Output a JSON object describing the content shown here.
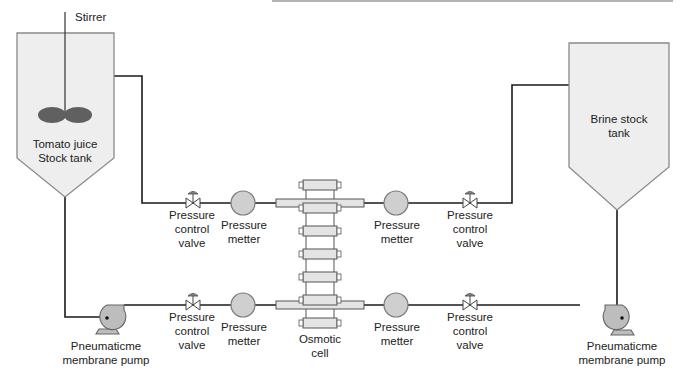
{
  "diagram": {
    "stirrer_label": "Stirrer",
    "tomato_tank": {
      "line1": "Tomato juice",
      "line2": "Stock tank"
    },
    "brine_tank": {
      "line1": "Brine stock",
      "line2": "tank"
    },
    "osmotic_cell": {
      "line1": "Osmotic",
      "line2": "cell"
    },
    "valve_label": {
      "line1": "Pressure",
      "line2": "control",
      "line3": "valve"
    },
    "meter_label": {
      "line1": "Pressure",
      "line2": "metter"
    },
    "pump_label": {
      "line1": "Pneumaticme",
      "line2": "membrane pump"
    },
    "components": {
      "valves": [
        "top-left",
        "top-right",
        "bottom-left",
        "bottom-right"
      ],
      "meters": [
        "top-left",
        "top-right",
        "bottom-left",
        "bottom-right"
      ],
      "pumps": [
        "left",
        "right"
      ]
    },
    "colors": {
      "pipe": "#1a1a1a",
      "tank_fill": "#eeeeee",
      "tank_stroke": "#8a8a8a",
      "stirrer_blade": "#606060",
      "gauge_fill": "#cfcfcf",
      "pump_fill": "#bdbdbd"
    }
  }
}
